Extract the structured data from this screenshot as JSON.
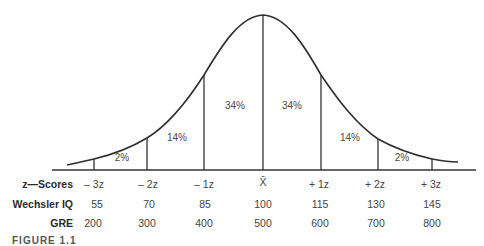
{
  "diagram": {
    "type": "normal-distribution-curve",
    "segments": [
      {
        "from": "-3z",
        "to": "-2z",
        "label": "2%"
      },
      {
        "from": "-2z",
        "to": "-1z",
        "label": "14%"
      },
      {
        "from": "-1z",
        "to": "mean",
        "label": "34%"
      },
      {
        "from": "mean",
        "to": "+1z",
        "label": "34%"
      },
      {
        "from": "+1z",
        "to": "+2z",
        "label": "14%"
      },
      {
        "from": "+2z",
        "to": "+3z",
        "label": "2%"
      }
    ]
  },
  "rows": [
    {
      "label": "z—Scores",
      "values": [
        "– 3z",
        "– 2z",
        "– 1z",
        "X̄",
        "+ 1z",
        "+ 2z",
        "+ 3z"
      ]
    },
    {
      "label": "Wechsler IQ",
      "values": [
        "55",
        "70",
        "85",
        "100",
        "115",
        "130",
        "145"
      ]
    },
    {
      "label": "GRE",
      "values": [
        "200",
        "300",
        "400",
        "500",
        "600",
        "700",
        "800"
      ]
    }
  ],
  "caption": "FIGURE 1.1"
}
